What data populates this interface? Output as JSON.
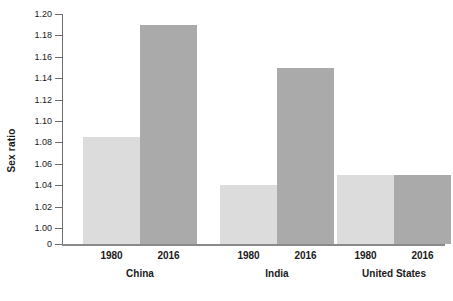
{
  "chart_data": {
    "type": "bar",
    "title": "",
    "xlabel": "",
    "ylabel": "Sex ratio",
    "ylim": [
      1.0,
      1.2
    ],
    "ytick_step": 0.02,
    "grid": false,
    "legend": "none",
    "axis_break": true,
    "baseline_tick_label": "0",
    "ytick_labels": [
      "1.20",
      "1.18",
      "1.16",
      "1.14",
      "1.12",
      "1.10",
      "1.08",
      "1.06",
      "1.04",
      "1.02",
      "1.00",
      "0"
    ],
    "ytick_values": [
      1.2,
      1.18,
      1.16,
      1.14,
      1.12,
      1.1,
      1.08,
      1.06,
      1.04,
      1.02,
      1.0
    ],
    "categories": [
      "China",
      "India",
      "United States"
    ],
    "series": [
      {
        "name": "1980",
        "color": "#dcdcdc",
        "values": [
          1.085,
          1.04,
          1.05
        ]
      },
      {
        "name": "2016",
        "color": "#aaaaaa",
        "values": [
          1.19,
          1.15,
          1.05
        ]
      }
    ],
    "groups": [
      {
        "label": "China",
        "bars": [
          {
            "year": "1980",
            "value": 1.085,
            "shade": "light"
          },
          {
            "year": "2016",
            "value": 1.19,
            "shade": "dark"
          }
        ]
      },
      {
        "label": "India",
        "bars": [
          {
            "year": "1980",
            "value": 1.04,
            "shade": "light"
          },
          {
            "year": "2016",
            "value": 1.15,
            "shade": "dark"
          }
        ]
      },
      {
        "label": "United States",
        "bars": [
          {
            "year": "1980",
            "value": 1.05,
            "shade": "light"
          },
          {
            "year": "2016",
            "value": 1.05,
            "shade": "dark"
          }
        ]
      }
    ],
    "colors": {
      "light_bar": "#dcdcdc",
      "dark_bar": "#aaaaaa",
      "axis": "#6e6e6e",
      "text": "#1a1a1a",
      "background": "#ffffff"
    }
  }
}
